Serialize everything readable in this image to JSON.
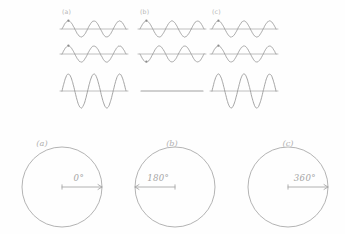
{
  "figure": {
    "background_color": "#fefefe",
    "stroke_color": "#9a9a9a",
    "style": "hand-drawn pencil sketch",
    "width": 345,
    "height": 234
  },
  "wave_section": {
    "columns": [
      {
        "id": "a",
        "label": "(a)",
        "label_x": 62,
        "phase_difference_deg": 0,
        "interference": "constructive",
        "rows": [
          {
            "role": "wave-1",
            "amplitude": 8,
            "cycles": 2.5,
            "phase_deg": 0,
            "has_dot_marker": true
          },
          {
            "role": "wave-2",
            "amplitude": 8,
            "cycles": 2.5,
            "phase_deg": 0,
            "has_dot_marker": true
          },
          {
            "role": "sum",
            "amplitude": 17,
            "cycles": 2.5,
            "phase_deg": 0,
            "flat": false
          }
        ]
      },
      {
        "id": "b",
        "label": "(b)",
        "label_x": 140,
        "phase_difference_deg": 180,
        "interference": "destructive",
        "rows": [
          {
            "role": "wave-1",
            "amplitude": 8,
            "cycles": 2.5,
            "phase_deg": 0,
            "has_dot_marker": true
          },
          {
            "role": "wave-2",
            "amplitude": 8,
            "cycles": 2.5,
            "phase_deg": 180,
            "has_dot_marker": true
          },
          {
            "role": "sum",
            "amplitude": 0,
            "cycles": 0,
            "phase_deg": 0,
            "flat": true
          }
        ]
      },
      {
        "id": "c",
        "label": "(c)",
        "label_x": 212,
        "phase_difference_deg": 360,
        "interference": "constructive",
        "rows": [
          {
            "role": "wave-1",
            "amplitude": 8,
            "cycles": 2.5,
            "phase_deg": 0,
            "has_dot_marker": true
          },
          {
            "role": "wave-2",
            "amplitude": 8,
            "cycles": 2.5,
            "phase_deg": 0,
            "has_dot_marker": true
          },
          {
            "role": "sum",
            "amplitude": 17,
            "cycles": 2.5,
            "phase_deg": 0,
            "flat": false
          }
        ]
      }
    ],
    "row_baselines": [
      29,
      54,
      91
    ]
  },
  "circle_section": {
    "circles": [
      {
        "id": "a",
        "label": "(a)",
        "angle_label": "0°",
        "cx": 62,
        "cy": 187,
        "r": 40,
        "arrow_direction": "right",
        "arrow_angle_deg": 0
      },
      {
        "id": "b",
        "label": "(b)",
        "angle_label": "180°",
        "cx": 175,
        "cy": 187,
        "r": 40,
        "arrow_direction": "left",
        "arrow_angle_deg": 180
      },
      {
        "id": "c",
        "label": "(c)",
        "angle_label": "360°",
        "cx": 288,
        "cy": 187,
        "r": 40,
        "arrow_direction": "right",
        "arrow_angle_deg": 360
      }
    ]
  },
  "chart_data": {
    "type": "line",
    "xlabel": "",
    "ylabel": "",
    "grid": false,
    "legend": "none",
    "panels": [
      {
        "panel": "(a)",
        "phase_difference_deg": 0,
        "result": "constructive interference",
        "series": [
          {
            "name": "wave 1",
            "amplitude": 1,
            "phase_deg": 0,
            "cycles": 2.5
          },
          {
            "name": "wave 2",
            "amplitude": 1,
            "phase_deg": 0,
            "cycles": 2.5
          },
          {
            "name": "sum",
            "amplitude": 2,
            "phase_deg": 0,
            "cycles": 2.5
          }
        ]
      },
      {
        "panel": "(b)",
        "phase_difference_deg": 180,
        "result": "destructive interference (flat line)",
        "series": [
          {
            "name": "wave 1",
            "amplitude": 1,
            "phase_deg": 0,
            "cycles": 2.5
          },
          {
            "name": "wave 2",
            "amplitude": 1,
            "phase_deg": 180,
            "cycles": 2.5
          },
          {
            "name": "sum",
            "amplitude": 0,
            "phase_deg": 0,
            "cycles": 0
          }
        ]
      },
      {
        "panel": "(c)",
        "phase_difference_deg": 360,
        "result": "constructive interference",
        "series": [
          {
            "name": "wave 1",
            "amplitude": 1,
            "phase_deg": 0,
            "cycles": 2.5
          },
          {
            "name": "wave 2",
            "amplitude": 1,
            "phase_deg": 0,
            "cycles": 2.5
          },
          {
            "name": "sum",
            "amplitude": 2,
            "phase_deg": 0,
            "cycles": 2.5
          }
        ]
      }
    ],
    "phase_circles": [
      {
        "panel": "(a)",
        "angle_deg": 0,
        "label": "0°"
      },
      {
        "panel": "(b)",
        "angle_deg": 180,
        "label": "180°"
      },
      {
        "panel": "(c)",
        "angle_deg": 360,
        "label": "360°"
      }
    ]
  }
}
